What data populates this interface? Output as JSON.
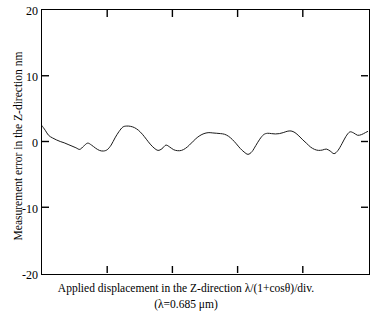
{
  "chart_data": {
    "type": "line",
    "title": "",
    "xlabel": "Applied displacement in the Z-direction λ/(1+cosθ)/div.",
    "xlabel_line2": "(λ=0.685 μm)",
    "ylabel": "Measurement error in the Z-direction nm",
    "ylim": [
      -20,
      20
    ],
    "yticks": [
      20,
      10,
      0,
      -10,
      -20
    ],
    "ytick_labels": [
      "20",
      "10",
      "0",
      "-10",
      "-20"
    ],
    "xlim": [
      0,
      5
    ],
    "xticks": [
      1,
      2,
      3,
      4
    ],
    "xtick_labels": [
      "",
      "",
      "",
      ""
    ],
    "grid": false,
    "legend": null,
    "line_color": "#1a1a1a",
    "line_width": 1.0,
    "series": [
      {
        "name": "Measurement error",
        "x": [
          0.0,
          0.05,
          0.1,
          0.16,
          0.22,
          0.28,
          0.34,
          0.4,
          0.46,
          0.52,
          0.58,
          0.64,
          0.7,
          0.76,
          0.82,
          0.88,
          0.94,
          1.0,
          1.06,
          1.12,
          1.18,
          1.24,
          1.3,
          1.36,
          1.42,
          1.48,
          1.54,
          1.6,
          1.66,
          1.72,
          1.78,
          1.84,
          1.9,
          1.96,
          2.02,
          2.08,
          2.14,
          2.2,
          2.26,
          2.32,
          2.38,
          2.44,
          2.5,
          2.56,
          2.62,
          2.68,
          2.74,
          2.8,
          2.86,
          2.92,
          2.98,
          3.04,
          3.1,
          3.16,
          3.22,
          3.28,
          3.34,
          3.4,
          3.46,
          3.52,
          3.58,
          3.64,
          3.7,
          3.76,
          3.82,
          3.88,
          3.94,
          4.0,
          4.06,
          4.12,
          4.18,
          4.24,
          4.3,
          4.36,
          4.42,
          4.48,
          4.54,
          4.6,
          4.66,
          4.72,
          4.78,
          4.84,
          4.9,
          4.96,
          5.0
        ],
        "y": [
          2.4,
          1.7,
          0.95,
          0.55,
          0.25,
          0.0,
          -0.2,
          -0.45,
          -0.7,
          -0.95,
          -1.2,
          -0.7,
          -0.25,
          -0.55,
          -1.0,
          -1.35,
          -1.45,
          -1.25,
          -0.55,
          0.55,
          1.5,
          2.2,
          2.35,
          2.3,
          2.1,
          1.7,
          1.1,
          0.35,
          -0.4,
          -1.0,
          -1.35,
          -1.1,
          -0.55,
          -0.85,
          -1.25,
          -1.4,
          -1.35,
          -1.05,
          -0.55,
          0.05,
          0.6,
          1.0,
          1.25,
          1.35,
          1.3,
          1.25,
          1.2,
          1.1,
          0.8,
          0.3,
          -0.35,
          -1.05,
          -1.6,
          -1.95,
          -1.55,
          -0.6,
          0.35,
          1.05,
          1.25,
          1.2,
          1.15,
          1.2,
          1.35,
          1.55,
          1.6,
          1.35,
          0.85,
          0.25,
          -0.3,
          -0.85,
          -1.2,
          -1.35,
          -1.3,
          -1.15,
          -1.45,
          -1.85,
          -1.35,
          -0.35,
          0.75,
          1.45,
          1.3,
          0.95,
          1.05,
          1.35,
          1.55
        ],
        "y_min": -1.95,
        "y_max": 2.4,
        "units": "nm"
      }
    ]
  },
  "axes": {
    "y_title": "Measurement error in the Z-direction nm",
    "x_title_line1": "Applied displacement in the Z-direction λ/(1+cosθ)/div.",
    "x_title_line2": "(λ=0.685 μm)",
    "ytick_labels": [
      "20",
      "10",
      "0",
      "-10",
      "-20"
    ]
  }
}
